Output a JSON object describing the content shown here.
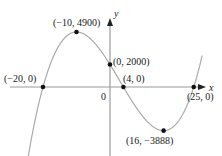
{
  "chart_data": {
    "type": "line",
    "title": "",
    "function": "y = (x + 20)(x - 4)(x - 25)",
    "xlabel": "x",
    "ylabel": "y",
    "origin_label": "0",
    "grid": false,
    "legend": null,
    "xlim": [
      -30,
      28
    ],
    "ylim": [
      -5400,
      6000
    ],
    "series": [
      {
        "name": "cubic",
        "color": "#aaaaaa",
        "x": [
          -29,
          -25,
          -20,
          -15,
          -10,
          -5,
          0,
          4,
          8,
          12,
          16,
          20,
          25,
          27
        ],
        "y": [
          -3654,
          -1740,
          0,
          3800,
          4900,
          4500,
          2000,
          0,
          -2508,
          -2056,
          -3888,
          -2400,
          0,
          1200
        ]
      }
    ],
    "labeled_points": [
      {
        "x": -20,
        "y": 0,
        "label": "(−20, 0)"
      },
      {
        "x": -10,
        "y": 4900,
        "label": "(−10, 4900)"
      },
      {
        "x": 0,
        "y": 2000,
        "label": "(0, 2000)"
      },
      {
        "x": 4,
        "y": 0,
        "label": "(4, 0)"
      },
      {
        "x": 25,
        "y": 0,
        "label": "(25, 0)"
      },
      {
        "x": 16,
        "y": -3888,
        "label": "(16, −3888)"
      }
    ],
    "colors": {
      "curve": "#aaaaaa",
      "axes": "#9a9a9a",
      "points": "#111111",
      "text": "#1a1a1a"
    }
  }
}
